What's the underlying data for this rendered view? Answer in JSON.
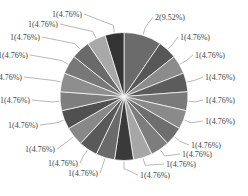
{
  "chart_data": {
    "type": "pie",
    "title": "",
    "start_angle": "12 o'clock",
    "direction": "clockwise",
    "values": [
      2,
      1,
      1,
      1,
      1,
      1,
      1,
      1,
      1,
      1,
      1,
      1,
      1,
      1,
      1,
      1,
      1,
      1,
      1,
      1
    ],
    "labels": [
      "2(9.52%)",
      "1(4.76%)",
      "1(4.76%)",
      "1(4.76%)",
      "1(4.76%)",
      "1(4.76%)",
      "1(4.76%)",
      "1(4.76%)",
      "1(4.76%)",
      "1(4.76%)",
      "1(4.76%)",
      "1(4.76%)",
      "1(4.76%)",
      "1(4.76%)",
      "1(4.76%)",
      "1(4.76%)",
      "1(4.76%)",
      "1(4.76%)",
      "1(4.76%)",
      "1(4.76%)"
    ],
    "percentages": [
      9.52,
      4.76,
      4.76,
      4.76,
      4.76,
      4.76,
      4.76,
      4.76,
      4.76,
      4.76,
      4.76,
      4.76,
      4.76,
      4.76,
      4.76,
      4.76,
      4.76,
      4.76,
      4.76,
      4.76
    ],
    "colors": [
      "#6b6b6b",
      "#575757",
      "#8c8c8c",
      "#5c5c5c",
      "#7a7a7a",
      "#8a8a8a",
      "#6e6e6e",
      "#7d7d7d",
      "#a6a6a6",
      "#3a3a3a",
      "#6a6a6a",
      "#595959",
      "#888888",
      "#505050",
      "#7e7e7e",
      "#8e8e8e",
      "#787878",
      "#6a6a6a",
      "#a8a8a8",
      "#333333"
    ],
    "label_positions": [
      [
        155,
        20
      ],
      [
        180,
        40
      ],
      [
        195,
        58
      ],
      [
        205,
        80
      ],
      [
        205,
        103
      ],
      [
        205,
        124
      ],
      [
        191,
        148
      ],
      [
        182,
        157
      ],
      [
        166,
        167
      ],
      [
        140,
        178
      ],
      [
        98,
        176
      ],
      [
        78,
        166
      ],
      [
        55,
        152
      ],
      [
        38,
        128
      ],
      [
        30,
        103
      ],
      [
        22,
        80
      ],
      [
        28,
        58
      ],
      [
        40,
        40
      ],
      [
        58,
        27
      ],
      [
        82,
        17
      ]
    ],
    "legend": "none",
    "grid": false
  }
}
